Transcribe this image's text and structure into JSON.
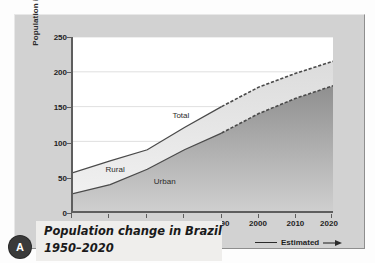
{
  "chart_data": {
    "type": "area",
    "title": "Population change in Brazil 1950–2020",
    "xlabel": "",
    "ylabel": "Population in millions",
    "xlim": [
      1950,
      2020
    ],
    "ylim": [
      0,
      250
    ],
    "grid": true,
    "legend_position": "bottom-right",
    "x": [
      1950,
      1960,
      1970,
      1980,
      1990,
      2000,
      2010,
      2020
    ],
    "xticks": [
      "1950",
      "1960",
      "1970",
      "1980",
      "1990",
      "2000",
      "2010",
      "2020"
    ],
    "yticks": [
      "0",
      "50",
      "100",
      "150",
      "200",
      "250"
    ],
    "estimated_from": 1990,
    "series": [
      {
        "name": "Total",
        "values": [
          55,
          72,
          88,
          120,
          150,
          178,
          198,
          215
        ]
      },
      {
        "name": "Urban",
        "values": [
          25,
          38,
          60,
          88,
          112,
          140,
          162,
          180
        ]
      }
    ],
    "band_label": "Rural",
    "annotations": [
      {
        "text": "Total",
        "x": 1980,
        "y": 135
      },
      {
        "text": "Rural",
        "x": 1962,
        "y": 58
      },
      {
        "text": "Urban",
        "x": 1975,
        "y": 40
      }
    ],
    "legend": [
      {
        "label": "Estimated",
        "style": "line-with-arrow"
      }
    ]
  },
  "caption": {
    "line1": "Population change in Brazil",
    "line2": "1950–2020",
    "badge": "A"
  },
  "colors": {
    "panel": "#d2d2d2",
    "plot_bg": "#ffffff",
    "axis": "#5e5e5e",
    "urban_fill": "#9a9a9a",
    "rural_fill": "#d9d9d9",
    "line": "#4a4a4a",
    "caption_bg": "#efeeec",
    "badge_bg": "#3a3a3a"
  }
}
